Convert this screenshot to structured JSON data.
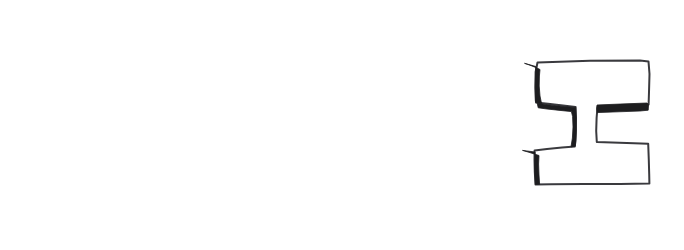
{
  "figure": {
    "kind": "scanned-handwritten-glyph",
    "background_color": "#ffffff",
    "frame": {
      "name": "bounding-box",
      "border_color": "#6f6f73",
      "border_width_px": 1,
      "x": 4,
      "y": 8,
      "width": 674,
      "height": 220
    },
    "glyph": {
      "character": "I",
      "description": "hand-drawn outlined capital letter I with slab serifs, shaded on the left and inner edges",
      "outline_color": "#3a3a3e",
      "fill_color": "#ffffff",
      "shadow_color": "#1d1d1f",
      "stroke_width_px": 2,
      "position": {
        "x": 522,
        "y": 58,
        "width": 130,
        "height": 128
      },
      "shaded_regions": [
        "upper-left-wedge",
        "inner-left-notch-wedge",
        "lower-left-wedge",
        "right-notch-bar"
      ]
    },
    "alt_text": "A wide white rectangle outlined in thin grey, empty except for a large hand-drawn letter I near the right edge, drawn in black outline with heavy black shading along its left and inner edges."
  }
}
